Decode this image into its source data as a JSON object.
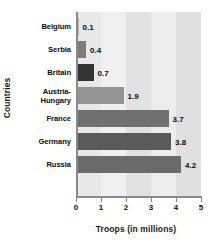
{
  "chart_data": {
    "type": "bar",
    "orientation": "horizontal",
    "title": "",
    "xlabel": "Troops (in millions)",
    "ylabel": "Countries",
    "categories": [
      "Belgium",
      "Serbia",
      "Britain",
      "Austria-Hungary",
      "France",
      "Germany",
      "Russia"
    ],
    "values": [
      0.1,
      0.4,
      0.7,
      1.9,
      3.7,
      3.8,
      4.2
    ],
    "value_labels": [
      "0.1",
      "0.4",
      "0.7",
      "1.9",
      "3.7",
      "3.8",
      "4.2"
    ],
    "bar_colors": [
      "#b4b4b4",
      "#7d7d7d",
      "#333333",
      "#949494",
      "#707070",
      "#5a5a5a",
      "#6b6b6b"
    ],
    "xlim": [
      0,
      5
    ],
    "xticks": [
      0,
      1,
      2,
      3,
      4,
      5
    ],
    "xtick_labels": [
      "0",
      "1",
      "2",
      "3",
      "4",
      "5"
    ],
    "grid": false,
    "legend": "none",
    "plot_background_bands": [
      "#e8e8e8",
      "#f0f0f0",
      "#e2e2e2",
      "#ececec",
      "#e0e0e0"
    ],
    "axis_color": "#8a8a8a"
  },
  "axis": {
    "x_title": "Troops (in millions)",
    "y_title": "Countries"
  },
  "category_label_lines": [
    [
      "Belgium"
    ],
    [
      "Serbia"
    ],
    [
      "Britain"
    ],
    [
      "Austria-",
      "Hungary"
    ],
    [
      "France"
    ],
    [
      "Germany"
    ],
    [
      "Russia"
    ]
  ]
}
